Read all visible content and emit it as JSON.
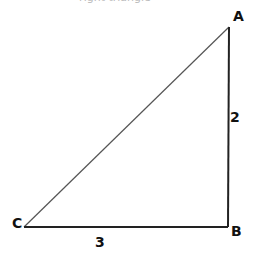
{
  "caption": "right triangle",
  "diagram": {
    "type": "right-triangle",
    "vertices": [
      {
        "label": "A",
        "x": 229,
        "y": 27
      },
      {
        "label": "B",
        "x": 228,
        "y": 227
      },
      {
        "label": "C",
        "x": 24,
        "y": 227
      }
    ],
    "sides": [
      {
        "between": "A-B",
        "label": "2"
      },
      {
        "between": "C-B",
        "label": "3"
      }
    ],
    "right_angle_at": "B",
    "line_color": "#222222"
  },
  "labels": {
    "A": "A",
    "B": "B",
    "C": "C",
    "side_ab": "2",
    "side_cb": "3"
  }
}
